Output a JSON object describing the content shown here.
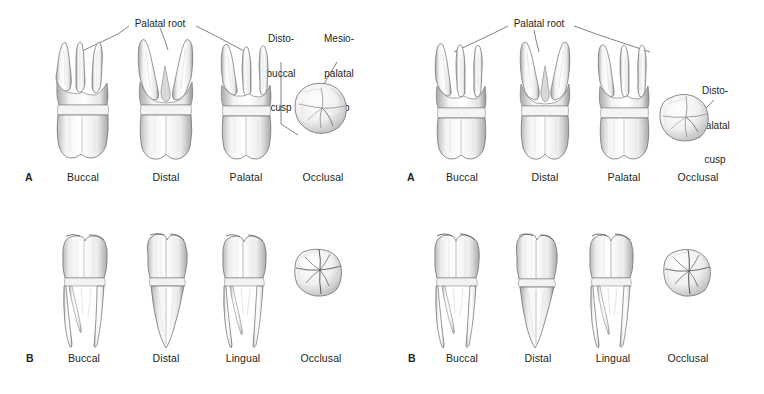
{
  "figure": {
    "background": "#ffffff",
    "ink": "#231f20",
    "leader_color": "#58595b",
    "panels": [
      {
        "id": "top-left",
        "row_letter": "A",
        "tooth_group": "maxillary molar",
        "views": [
          {
            "label": "Buccal",
            "type": "multiroot-buccal"
          },
          {
            "label": "Distal",
            "type": "multiroot-distal"
          },
          {
            "label": "Palatal",
            "type": "multiroot-palatal"
          },
          {
            "label": "Occlusal",
            "type": "occlusal-maxillary"
          }
        ],
        "annotations": [
          {
            "text": "Palatal root",
            "lines": [
              "Palatal root"
            ],
            "name": "palatal-root-label"
          },
          {
            "text": "Disto-buccal cusp",
            "lines": [
              "Disto-",
              "buccal",
              "cusp"
            ],
            "name": "disto-buccal-cusp-label"
          },
          {
            "text": "Mesio-palatal cusp",
            "lines": [
              "Mesio-",
              "palatal",
              "cusp"
            ],
            "name": "mesio-palatal-cusp-label"
          }
        ]
      },
      {
        "id": "top-right",
        "row_letter": "A",
        "tooth_group": "maxillary molar",
        "views": [
          {
            "label": "Buccal",
            "type": "multiroot-buccal"
          },
          {
            "label": "Distal",
            "type": "multiroot-distal"
          },
          {
            "label": "Palatal",
            "type": "multiroot-palatal"
          },
          {
            "label": "Occlusal",
            "type": "occlusal-maxillary"
          }
        ],
        "annotations": [
          {
            "text": "Palatal root",
            "lines": [
              "Palatal root"
            ],
            "name": "palatal-root-label"
          },
          {
            "text": "Disto-palatal cusp",
            "lines": [
              "Disto-",
              "palatal",
              "cusp"
            ],
            "name": "disto-palatal-cusp-label"
          }
        ]
      },
      {
        "id": "bottom-left",
        "row_letter": "B",
        "tooth_group": "mandibular molar",
        "views": [
          {
            "label": "Buccal",
            "type": "biroot-buccal"
          },
          {
            "label": "Distal",
            "type": "biroot-distal"
          },
          {
            "label": "Lingual",
            "type": "biroot-lingual"
          },
          {
            "label": "Occlusal",
            "type": "occlusal-mandibular"
          }
        ],
        "annotations": []
      },
      {
        "id": "bottom-right",
        "row_letter": "B",
        "tooth_group": "mandibular molar",
        "views": [
          {
            "label": "Buccal",
            "type": "biroot-buccal"
          },
          {
            "label": "Distal",
            "type": "biroot-distal"
          },
          {
            "label": "Lingual",
            "type": "biroot-lingual"
          },
          {
            "label": "Occlusal",
            "type": "occlusal-mandibular"
          }
        ],
        "annotations": []
      }
    ]
  },
  "labels": {
    "tl": {
      "row": "A",
      "v1": "Buccal",
      "v2": "Distal",
      "v3": "Palatal",
      "v4": "Occlusal",
      "palatal_root": "Palatal root",
      "db1": "Disto-",
      "db2": "buccal",
      "db3": "cusp",
      "mp1": "Mesio-",
      "mp2": "palatal",
      "mp3": "cusp"
    },
    "tr": {
      "row": "A",
      "v1": "Buccal",
      "v2": "Distal",
      "v3": "Palatal",
      "v4": "Occlusal",
      "palatal_root": "Palatal root",
      "dp1": "Disto-",
      "dp2": "palatal",
      "dp3": "cusp"
    },
    "bl": {
      "row": "B",
      "v1": "Buccal",
      "v2": "Distal",
      "v3": "Lingual",
      "v4": "Occlusal"
    },
    "br": {
      "row": "B",
      "v1": "Buccal",
      "v2": "Distal",
      "v3": "Lingual",
      "v4": "Occlusal"
    }
  }
}
